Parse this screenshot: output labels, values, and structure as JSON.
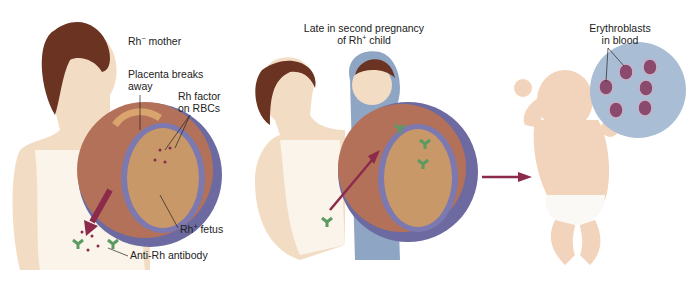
{
  "panels": [
    {
      "id": "first-pregnancy",
      "labels": {
        "mother": {
          "text": "Rh",
          "sup": "−",
          "rest": " mother"
        },
        "placenta": {
          "line1": "Placenta breaks",
          "line2": "away"
        },
        "rh_factor": {
          "line1": "Rh factor",
          "line2": "on RBCs"
        },
        "fetus": {
          "text": "Rh",
          "sup": "+",
          "rest": " fetus"
        },
        "antibody": {
          "text": "Anti-Rh antibody"
        }
      }
    },
    {
      "id": "second-pregnancy",
      "labels": {
        "caption": {
          "line1": "Late in second pregnancy",
          "line2_pre": "of Rh",
          "line2_sup": "+",
          "line2_post": " child"
        }
      }
    },
    {
      "id": "newborn",
      "labels": {
        "erythroblasts": {
          "line1": "Erythroblasts",
          "line2": "in blood"
        }
      }
    }
  ],
  "colors": {
    "arrow": "#8b2a4a",
    "uterus_outer": "#b4715a",
    "uterus_inner": "#6c6aa0",
    "fetus": "#c99868",
    "skin": "#f3dcc4",
    "hair": "#6b3322",
    "antibody": "#5c9a63",
    "blood_circle": "#a9bdd4",
    "erythroblast": "#8a4a6e"
  }
}
